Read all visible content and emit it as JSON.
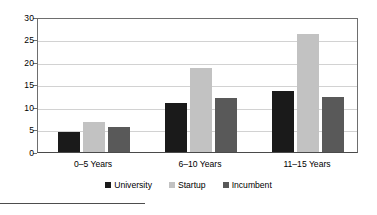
{
  "chart_data": {
    "type": "bar",
    "title": "",
    "subtitle": "",
    "xlabel": "",
    "ylabel": "",
    "categories": [
      "0–5 Years",
      "6–10 Years",
      "11–15 Years"
    ],
    "series": [
      {
        "name": "University",
        "color": "#1a1a1a",
        "values": [
          4.5,
          10.9,
          13.6
        ]
      },
      {
        "name": "Startup",
        "color": "#c2c2c2",
        "values": [
          6.7,
          18.6,
          26.2
        ]
      },
      {
        "name": "Incumbent",
        "color": "#595959",
        "values": [
          5.5,
          12.0,
          12.2
        ]
      }
    ],
    "ylim": [
      0,
      30
    ],
    "yticks": [
      0,
      5,
      10,
      15,
      20,
      25,
      30
    ],
    "ytick_labels": [
      "0",
      "5",
      "10",
      "15",
      "20",
      "25",
      "30"
    ],
    "grid": true,
    "grid_axis": "y",
    "legend_position": "bottom",
    "annotations": []
  },
  "footnote": {
    "rule_visible": true
  }
}
